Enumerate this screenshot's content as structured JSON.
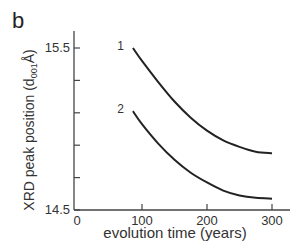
{
  "panel_label": "b",
  "chart_data": {
    "type": "line",
    "title": "",
    "xlabel": "evolution time (years)",
    "ylabel": "XRD peak position (d001 Å)",
    "ylabel_parts": {
      "prefix": "XRD peak position (d",
      "subscript": "001",
      "suffix": "Å)"
    },
    "xlim": [
      0,
      300
    ],
    "ylim": [
      14.5,
      15.5
    ],
    "x_ticks": [
      0,
      100,
      200,
      300
    ],
    "x_tick_labels": [
      "0",
      "100",
      "200",
      "300"
    ],
    "y_ticks": [
      14.5,
      14.7,
      14.9,
      15.1,
      15.3,
      15.5
    ],
    "y_tick_labels": [
      "14.5",
      "",
      "",
      "",
      "",
      "15.5"
    ],
    "grid": false,
    "legend": "inline labels at curve start",
    "series": [
      {
        "name": "1",
        "x": [
          86,
          100,
          125,
          150,
          175,
          200,
          225,
          250,
          275,
          300
        ],
        "values": [
          15.5,
          15.42,
          15.29,
          15.17,
          15.07,
          14.99,
          14.93,
          14.89,
          14.86,
          14.85
        ]
      },
      {
        "name": "2",
        "x": [
          86,
          100,
          125,
          150,
          175,
          200,
          225,
          250,
          275,
          300
        ],
        "values": [
          15.11,
          15.03,
          14.91,
          14.81,
          14.73,
          14.67,
          14.62,
          14.59,
          14.575,
          14.57
        ]
      }
    ]
  },
  "colors": {
    "line": "#222222",
    "axis": "#444444"
  }
}
